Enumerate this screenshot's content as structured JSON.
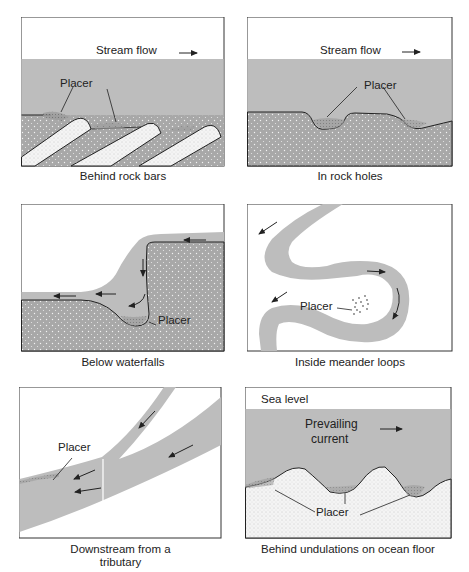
{
  "figure": {
    "panels": [
      {
        "id": "rock-bars",
        "caption": "Behind rock bars",
        "labels": {
          "flow": "Stream flow",
          "placer": "Placer"
        }
      },
      {
        "id": "rock-holes",
        "caption": "In rock holes",
        "labels": {
          "flow": "Stream flow",
          "placer": "Placer"
        }
      },
      {
        "id": "waterfalls",
        "caption": "Below waterfalls",
        "labels": {
          "placer": "Placer"
        }
      },
      {
        "id": "meander",
        "caption": "Inside meander loops",
        "labels": {
          "placer": "Placer"
        }
      },
      {
        "id": "tributary",
        "caption_line1": "Downstream from a",
        "caption_line2": "tributary",
        "labels": {
          "placer": "Placer"
        }
      },
      {
        "id": "ocean-floor",
        "caption": "Behind undulations on ocean floor",
        "labels": {
          "sea_level": "Sea level",
          "current_line1": "Prevailing",
          "current_line2": "current",
          "placer": "Placer"
        }
      }
    ],
    "colors": {
      "water": "#bdbdbd",
      "rock": "#a9a9a9",
      "light_rock": "#efefef",
      "outline": "#222222"
    }
  }
}
